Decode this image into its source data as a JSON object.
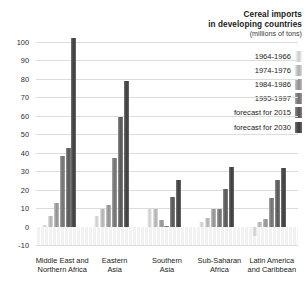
{
  "title": {
    "line1": "Cereal imports",
    "line2": "in developing countries",
    "units": "(millions of tons)"
  },
  "axis": {
    "yticks": [
      "100",
      "90",
      "80",
      "70",
      "60",
      "50",
      "40",
      "30",
      "20",
      "10",
      "0",
      "-10"
    ],
    "ymin": -10,
    "ymax": 100,
    "ystep": 10
  },
  "legend": {
    "items": [
      {
        "label": "1964-1966",
        "color": "#d9d9d9"
      },
      {
        "label": "1974-1976",
        "color": "#bdbdbd"
      },
      {
        "label": "1984-1986",
        "color": "#9e9e9e"
      },
      {
        "label": "1995-1997",
        "color": "#7d7d7d"
      },
      {
        "label": "forecast for 2015",
        "color": "#636363"
      },
      {
        "label": "forecast for 2030",
        "color": "#4a4a4a"
      }
    ]
  },
  "categories": [
    {
      "line1": "Middle East and",
      "line2": "Northern Africa"
    },
    {
      "line1": "Eastern",
      "line2": "Asia"
    },
    {
      "line1": "Southern",
      "line2": "Asia"
    },
    {
      "line1": "Sub-Saharan",
      "line2": "Africa"
    },
    {
      "line1": "Latin America",
      "line2": "and Caribbean"
    }
  ],
  "chart_data": {
    "type": "bar",
    "title": "Cereal imports in developing countries (millions of tons)",
    "xlabel": "",
    "ylabel": "millions of tons",
    "ylim": [
      -10,
      100
    ],
    "ystep": 10,
    "grid": true,
    "legend_position": "top-right",
    "categories": [
      "Middle East and Northern Africa",
      "Eastern Asia",
      "Southern Asia",
      "Sub-Saharan Africa",
      "Latin America and Caribbean"
    ],
    "series": [
      {
        "name": "1964-1966",
        "color": "#d9d9d9",
        "values": [
          1.0,
          5.5,
          9.5,
          2.3,
          -5.0
        ]
      },
      {
        "name": "1974-1976",
        "color": "#bdbdbd",
        "values": [
          5.5,
          9.7,
          9.5,
          4.7,
          2.5
        ]
      },
      {
        "name": "1984-1986",
        "color": "#9e9e9e",
        "values": [
          12.5,
          11.5,
          3.5,
          9.7,
          4.0
        ]
      },
      {
        "name": "1995-1997",
        "color": "#7d7d7d",
        "values": [
          38.0,
          37.0,
          0.3,
          9.7,
          15.3
        ]
      },
      {
        "name": "forecast for 2015",
        "color": "#636363",
        "values": [
          42.5,
          59.5,
          16.0,
          20.5,
          25.0
        ]
      },
      {
        "name": "forecast for 2030",
        "color": "#4a4a4a",
        "values": [
          102.0,
          79.0,
          25.3,
          32.0,
          31.5
        ]
      }
    ]
  }
}
